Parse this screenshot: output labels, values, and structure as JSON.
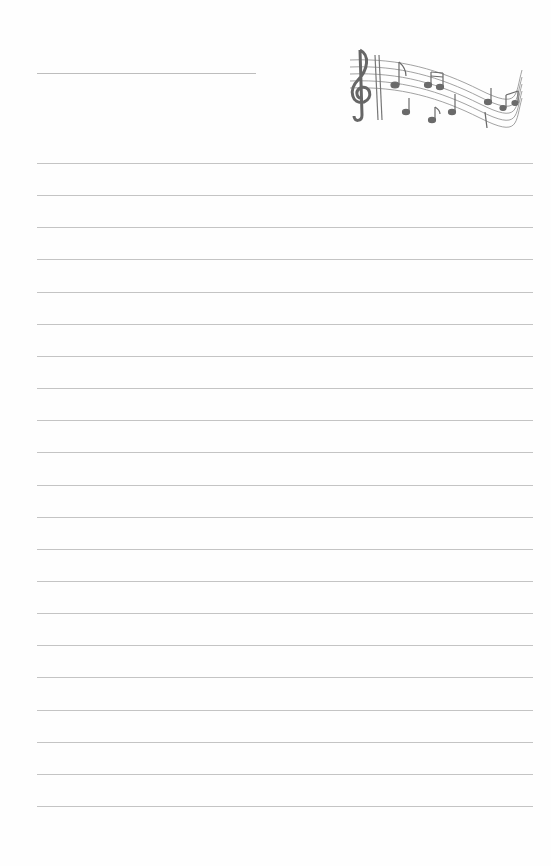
{
  "page": {
    "type": "lined stationery",
    "background": "#fefefe",
    "line_color": "#c4c4c4",
    "name_line": {
      "left": 37,
      "top": 73,
      "width": 219
    },
    "rules": {
      "count": 21,
      "first_top": 163,
      "spacing": 32.15,
      "left": 37,
      "width": 496
    },
    "decoration": "music-staff-with-treble-clef-and-notes"
  }
}
